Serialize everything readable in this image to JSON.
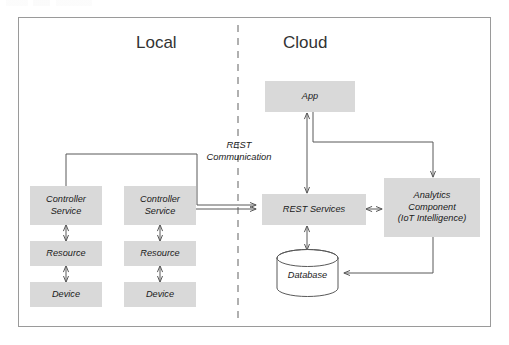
{
  "diagram": {
    "title_artifact": "",
    "zones": [
      {
        "id": "local",
        "label": "Local"
      },
      {
        "id": "cloud",
        "label": "Cloud"
      }
    ],
    "divider": {
      "style": "dashed",
      "color": "#8f8f8f"
    },
    "edge_labels": [
      {
        "id": "rest-communication",
        "line1": "REST",
        "line2": "Communication"
      }
    ],
    "nodes": [
      {
        "id": "controller-service-1",
        "label": "Controller Service",
        "line1": "Controller",
        "line2": "Service",
        "zone": "local",
        "shape": "rect",
        "fill": "#d9d9d9"
      },
      {
        "id": "resource-1",
        "label": "Resource",
        "line1": "Resource",
        "line2": "",
        "zone": "local",
        "shape": "rect",
        "fill": "#d9d9d9"
      },
      {
        "id": "device-1",
        "label": "Device",
        "line1": "Device",
        "line2": "",
        "zone": "local",
        "shape": "rect",
        "fill": "#d9d9d9"
      },
      {
        "id": "controller-service-2",
        "label": "Controller Service",
        "line1": "Controller",
        "line2": "Service",
        "zone": "local",
        "shape": "rect",
        "fill": "#d9d9d9"
      },
      {
        "id": "resource-2",
        "label": "Resource",
        "line1": "Resource",
        "line2": "",
        "zone": "local",
        "shape": "rect",
        "fill": "#d9d9d9"
      },
      {
        "id": "device-2",
        "label": "Device",
        "line1": "Device",
        "line2": "",
        "zone": "local",
        "shape": "rect",
        "fill": "#d9d9d9"
      },
      {
        "id": "app",
        "label": "App",
        "line1": "App",
        "line2": "",
        "zone": "cloud",
        "shape": "rect",
        "fill": "#d9d9d9"
      },
      {
        "id": "rest-services",
        "label": "REST Services",
        "line1": "REST Services",
        "line2": "",
        "zone": "cloud",
        "shape": "rect",
        "fill": "#d9d9d9"
      },
      {
        "id": "analytics-component",
        "label": "Analytics Component (IoT Intelligence)",
        "line1": "Analytics",
        "line2": "Component",
        "line3": "(IoT Intelligence)",
        "zone": "cloud",
        "shape": "rect",
        "fill": "#d9d9d9"
      },
      {
        "id": "database",
        "label": "Database",
        "line1": "Database",
        "line2": "",
        "zone": "cloud",
        "shape": "cylinder",
        "fill": "#ffffff"
      }
    ],
    "connections": [
      {
        "from": "controller-service-1",
        "to": "resource-1",
        "arrow": "both"
      },
      {
        "from": "resource-1",
        "to": "device-1",
        "arrow": "both"
      },
      {
        "from": "controller-service-2",
        "to": "resource-2",
        "arrow": "both"
      },
      {
        "from": "resource-2",
        "to": "device-2",
        "arrow": "both"
      },
      {
        "from": "controller-service-1",
        "to": "rest-services",
        "arrow": "to"
      },
      {
        "from": "controller-service-2",
        "to": "rest-services",
        "arrow": "to"
      },
      {
        "from": "app",
        "to": "rest-services",
        "arrow": "both"
      },
      {
        "from": "app",
        "to": "analytics-component",
        "arrow": "to"
      },
      {
        "from": "rest-services",
        "to": "analytics-component",
        "arrow": "both"
      },
      {
        "from": "rest-services",
        "to": "database",
        "arrow": "both"
      },
      {
        "from": "analytics-component",
        "to": "database",
        "arrow": "to"
      }
    ],
    "colors": {
      "node_fill": "#d9d9d9",
      "stroke": "#595959",
      "frame": "#9a9a9a",
      "text": "#1a1a1a"
    }
  }
}
